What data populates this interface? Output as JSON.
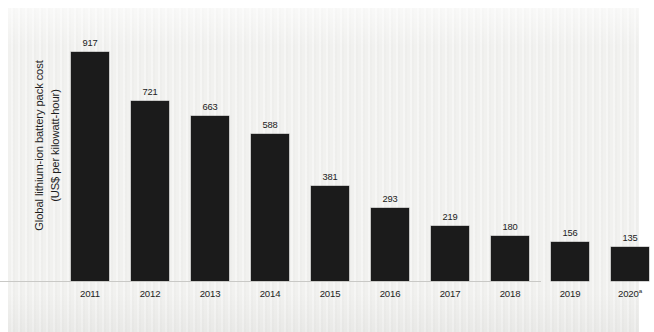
{
  "figure": {
    "background_color": "#f1f1ef",
    "page_color": "#ffffff",
    "bar_color": "#1b1b1b",
    "text_color": "#1d1d1d",
    "axis_color": "#c9c9c6"
  },
  "axis": {
    "y_title_line1": "Global lithium-ion battery pack cost",
    "y_title_line2": "(US$ per kilowatt-hour)"
  },
  "chart_data": {
    "type": "bar",
    "title": "",
    "subtitle": "",
    "xlabel": "",
    "ylabel": "Global lithium-ion battery pack cost (US$ per kilowatt-hour)",
    "categories": [
      "2011",
      "2012",
      "2013",
      "2014",
      "2015",
      "2016",
      "2017",
      "2018",
      "2019",
      "2020"
    ],
    "tick_labels": [
      "2011",
      "2012",
      "2013",
      "2014",
      "2015",
      "2016",
      "2017",
      "2018",
      "2019",
      "2020"
    ],
    "tick_label_superscripts": [
      "",
      "",
      "",
      "",
      "",
      "",
      "",
      "",
      "",
      "a"
    ],
    "values": [
      917,
      721,
      663,
      588,
      381,
      293,
      219,
      180,
      156,
      135
    ],
    "data_labels": [
      "917",
      "721",
      "663",
      "588",
      "381",
      "293",
      "219",
      "180",
      "156",
      "135"
    ],
    "ylim": [
      0,
      1055
    ],
    "grid": false,
    "legend": null,
    "legend_position": "none",
    "y_axis_ticks_visible": false,
    "baseline_visible": true
  }
}
